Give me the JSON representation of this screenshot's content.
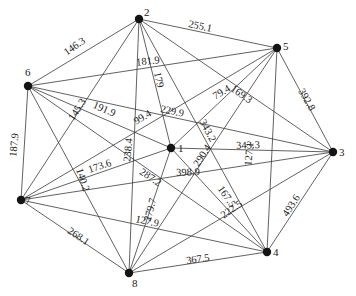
{
  "diagram": {
    "type": "weighted-complete-graph",
    "nodes": [
      {
        "id": "1",
        "x": 171,
        "y": 148,
        "label_dx": 7,
        "label_dy": 4
      },
      {
        "id": "2",
        "x": 139,
        "y": 19,
        "label_dx": 5,
        "label_dy": -3
      },
      {
        "id": "3",
        "x": 333,
        "y": 152,
        "label_dx": 6,
        "label_dy": 4
      },
      {
        "id": "4",
        "x": 267,
        "y": 252,
        "label_dx": 6,
        "label_dy": 4
      },
      {
        "id": "5",
        "x": 277,
        "y": 48,
        "label_dx": 6,
        "label_dy": 2
      },
      {
        "id": "6",
        "x": 28,
        "y": 86,
        "label_dx": -3,
        "label_dy": -10
      },
      {
        "id": "7",
        "x": 21,
        "y": 200,
        "label_dx": 4,
        "label_dy": 4
      },
      {
        "id": "8",
        "x": 129,
        "y": 273,
        "label_dx": 3,
        "label_dy": 14
      }
    ],
    "edges": [
      {
        "from": "6",
        "to": "2",
        "weight": "146.3",
        "lx": 75,
        "ly": 47,
        "angle": -35
      },
      {
        "from": "2",
        "to": "5",
        "weight": "255.1",
        "lx": 200,
        "ly": 27,
        "angle": 12
      },
      {
        "from": "5",
        "to": "3",
        "weight": "392.8",
        "lx": 306,
        "ly": 100,
        "angle": 60
      },
      {
        "from": "3",
        "to": "4",
        "weight": "493.6",
        "lx": 292,
        "ly": 206,
        "angle": -57
      },
      {
        "from": "8",
        "to": "4",
        "weight": "367.5",
        "lx": 198,
        "ly": 260,
        "angle": -8
      },
      {
        "from": "7",
        "to": "8",
        "weight": "268.1",
        "lx": 78,
        "ly": 237,
        "angle": 34
      },
      {
        "from": "6",
        "to": "7",
        "weight": "187.9",
        "lx": 15,
        "ly": 145,
        "angle": -85
      },
      {
        "from": "6",
        "to": "5",
        "weight": "181.9",
        "lx": 148,
        "ly": 62,
        "angle": -6
      },
      {
        "from": "2",
        "to": "1",
        "weight": "179",
        "lx": 158,
        "ly": 80,
        "angle": 78
      },
      {
        "from": "6",
        "to": "1",
        "weight": "191.9",
        "lx": 104,
        "ly": 110,
        "angle": 23
      },
      {
        "from": "6",
        "to": "3",
        "weight": "229.9",
        "lx": 172,
        "ly": 112,
        "angle": 12
      },
      {
        "from": "7",
        "to": "5",
        "weight": "99.4",
        "lx": 143,
        "ly": 118,
        "angle": -30
      },
      {
        "from": "7",
        "to": "5",
        "weight": "79.4",
        "lx": 222,
        "ly": 93,
        "angle": -30
      },
      {
        "from": "2",
        "to": "7",
        "weight": "145.3",
        "lx": 78,
        "ly": 110,
        "angle": -57
      },
      {
        "from": "2",
        "to": "8",
        "weight": "238.4",
        "lx": 129,
        "ly": 150,
        "angle": -85
      },
      {
        "from": "7",
        "to": "1",
        "weight": "173.6",
        "lx": 100,
        "ly": 167,
        "angle": -19
      },
      {
        "from": "6",
        "to": "8",
        "weight": "140.2",
        "lx": 82,
        "ly": 180,
        "angle": 72
      },
      {
        "from": "6",
        "to": "4",
        "weight": "287.2",
        "lx": 150,
        "ly": 178,
        "angle": 34
      },
      {
        "from": "7",
        "to": "3",
        "weight": "398.9",
        "lx": 188,
        "ly": 173,
        "angle": -2
      },
      {
        "from": "8",
        "to": "5",
        "weight": "290.4",
        "lx": 203,
        "ly": 156,
        "angle": -57
      },
      {
        "from": "2",
        "to": "4",
        "weight": "343.2",
        "lx": 207,
        "ly": 131,
        "angle": 62
      },
      {
        "from": "2",
        "to": "3",
        "weight": "169.3",
        "lx": 241,
        "ly": 95,
        "angle": 35
      },
      {
        "from": "1",
        "to": "3",
        "weight": "343.3",
        "lx": 248,
        "ly": 146,
        "angle": -2
      },
      {
        "from": "5",
        "to": "4",
        "weight": "127.1",
        "lx": 250,
        "ly": 154,
        "angle": -85
      },
      {
        "from": "1",
        "to": "4",
        "weight": "167.5",
        "lx": 226,
        "ly": 197,
        "angle": 55
      },
      {
        "from": "8",
        "to": "3",
        "weight": "222.5",
        "lx": 232,
        "ly": 210,
        "angle": -35
      },
      {
        "from": "8",
        "to": "1",
        "weight": "279.7",
        "lx": 151,
        "ly": 210,
        "angle": -75
      },
      {
        "from": "7",
        "to": "4",
        "weight": "127.9",
        "lx": 147,
        "ly": 222,
        "angle": 12
      },
      {
        "from": "1",
        "to": "5",
        "weight": "",
        "lx": 0,
        "ly": 0,
        "angle": 0
      },
      {
        "from": "1",
        "to": "2",
        "weight": "",
        "lx": 0,
        "ly": 0,
        "angle": 0
      },
      {
        "from": "6",
        "to": "3",
        "weight": "",
        "lx": 0,
        "ly": 0,
        "angle": 0
      },
      {
        "from": "7",
        "to": "2",
        "weight": "",
        "lx": 0,
        "ly": 0,
        "angle": 0
      },
      {
        "from": "8",
        "to": "2",
        "weight": "",
        "lx": 0,
        "ly": 0,
        "angle": 0
      },
      {
        "from": "4",
        "to": "5",
        "weight": "",
        "lx": 0,
        "ly": 0,
        "angle": 0
      }
    ]
  }
}
